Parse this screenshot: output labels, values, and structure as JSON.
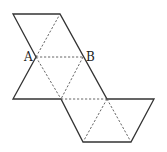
{
  "diagram": {
    "type": "polyhedron-net",
    "labels": [
      {
        "id": "A",
        "text": "A",
        "x": 24,
        "y": 61
      },
      {
        "id": "B",
        "text": "B",
        "x": 86,
        "y": 61
      }
    ],
    "points": {
      "P1": [
        13,
        14
      ],
      "P2": [
        60,
        14
      ],
      "A": [
        36,
        57
      ],
      "B": [
        83,
        57
      ],
      "P5": [
        13,
        99
      ],
      "P6": [
        61,
        99
      ],
      "P7": [
        107,
        99
      ],
      "P8": [
        154,
        99
      ],
      "P9": [
        83,
        142
      ],
      "P10": [
        131,
        142
      ]
    },
    "outline_color": "#333333",
    "fold_line_color": "#555555"
  }
}
